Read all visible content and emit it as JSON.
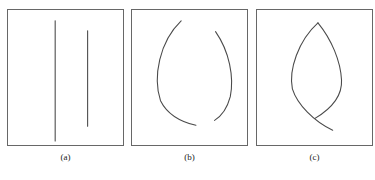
{
  "figure": {
    "background_color": "#ffffff",
    "stroke_color": "#4a4a4a",
    "border_color": "#676767",
    "width": 375,
    "height": 180
  },
  "panels": [
    {
      "id": "a",
      "caption": "(a)",
      "description": "two separate straight vertical line segments",
      "elements": [
        {
          "name": "left-vertical-line",
          "type": "line",
          "x1": 48,
          "y1": 11,
          "x2": 48,
          "y2": 133
        },
        {
          "name": "right-vertical-line",
          "type": "line",
          "x1": 81,
          "y1": 21,
          "x2": 81,
          "y2": 118
        }
      ]
    },
    {
      "id": "b",
      "caption": "(b)",
      "description": "two separate curved arcs bowing away from each other",
      "elements": [
        {
          "name": "left-arc",
          "type": "curve",
          "path": "M 50 11 C 28 32 21 68 29 92 C 37 108 52 114 65 117"
        },
        {
          "name": "right-arc",
          "type": "curve",
          "path": "M 85 22 C 99 42 104 68 100 88 C 96 103 89 109 84 112"
        }
      ]
    },
    {
      "id": "c",
      "caption": "(c)",
      "description": "the two curves joined into a closed leaf or lens shape with a crossing tail at the bottom",
      "elements": [
        {
          "name": "left-leaf-curve",
          "type": "curve",
          "path": "M 62 13 C 42 31 32 61 36 80 C 41 96 58 113 77 122"
        },
        {
          "name": "right-leaf-curve",
          "type": "curve",
          "path": "M 62 13 C 76 30 85 52 86 71 C 87 89 74 101 59 110"
        }
      ]
    }
  ]
}
